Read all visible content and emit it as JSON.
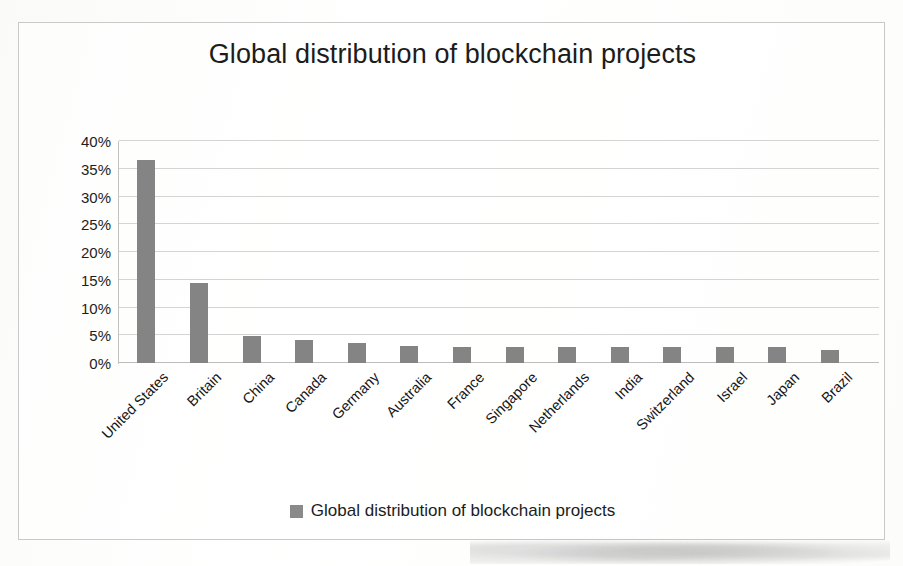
{
  "chart_data": {
    "type": "bar",
    "title": "Global distribution of blockchain projects",
    "xlabel": "",
    "ylabel": "",
    "ylim": [
      0,
      40
    ],
    "ytick_labels": [
      "40%",
      "35%",
      "30%",
      "25%",
      "20%",
      "15%",
      "10%",
      "5%",
      "0%"
    ],
    "ytick_values": [
      40,
      35,
      30,
      25,
      20,
      15,
      10,
      5,
      0
    ],
    "grid": true,
    "legend_position": "bottom",
    "legend": [
      "Global distribution of blockchain projects"
    ],
    "series_name": "Global distribution of blockchain projects",
    "bar_color": "#848484",
    "categories": [
      "United States",
      "Britain",
      "China",
      "Canada",
      "Germany",
      "Australia",
      "France",
      "Singapore",
      "Netherlands",
      "India",
      "Switzerland",
      "Israel",
      "Japan",
      "Brazil"
    ],
    "values": [
      36.5,
      14.5,
      4.8,
      4.2,
      3.6,
      3.0,
      2.9,
      2.9,
      2.9,
      2.9,
      2.8,
      2.8,
      2.8,
      2.3
    ],
    "value_unit": "%"
  },
  "legend": {
    "label": "Global distribution of blockchain projects",
    "swatch_color": "#8a8a8a"
  },
  "colors": {
    "bar": "#848484",
    "gridline": "#d4d4d4",
    "frame": "#c9c9c9",
    "text": "#1c1c1c"
  }
}
